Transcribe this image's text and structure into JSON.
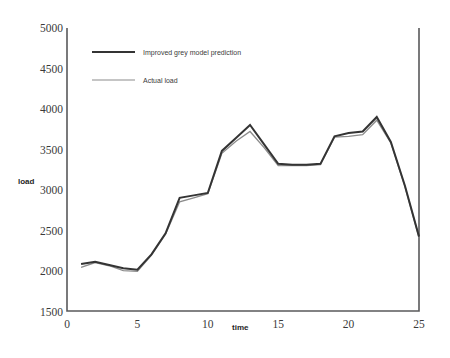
{
  "chart_data": {
    "type": "line",
    "title": "",
    "xlabel": "time",
    "ylabel": "load",
    "xlim": [
      0,
      25
    ],
    "ylim": [
      1500,
      5000
    ],
    "xticks": [
      0,
      5,
      10,
      15,
      20,
      25
    ],
    "yticks": [
      1500,
      2000,
      2500,
      3000,
      3500,
      4000,
      4500,
      5000
    ],
    "grid": false,
    "legend_position": "upper-left-inside",
    "x": [
      1,
      2,
      3,
      4,
      5,
      6,
      7,
      8,
      9,
      10,
      11,
      12,
      13,
      14,
      15,
      16,
      17,
      18,
      19,
      20,
      21,
      22,
      23,
      24,
      25
    ],
    "series": [
      {
        "name": "Improved grey model prediction",
        "color": "#343434",
        "values": [
          2080,
          2110,
          2070,
          2030,
          2010,
          2200,
          2460,
          2900,
          2930,
          2960,
          3480,
          3640,
          3800,
          3560,
          3320,
          3310,
          3310,
          3320,
          3660,
          3700,
          3720,
          3900,
          3590,
          3050,
          2420
        ]
      },
      {
        "name": "Actual load",
        "color": "#8c8c8c",
        "values": [
          2040,
          2100,
          2060,
          2000,
          1990,
          2190,
          2450,
          2850,
          2900,
          2950,
          3450,
          3600,
          3720,
          3520,
          3300,
          3300,
          3300,
          3310,
          3650,
          3660,
          3680,
          3860,
          3580,
          3040,
          2410
        ]
      }
    ]
  },
  "legend": {
    "items": [
      {
        "label": "Improved grey model prediction"
      },
      {
        "label": "Actual load"
      }
    ]
  },
  "axes": {
    "y_label": "load",
    "x_label": "time",
    "y_ticks": [
      "5000",
      "4500",
      "4000",
      "3500",
      "3000",
      "2500",
      "2000",
      "1500"
    ],
    "x_ticks": [
      "0",
      "5",
      "10",
      "15",
      "20",
      "25"
    ]
  },
  "colors": {
    "prediction": "#343434",
    "actual": "#8c8c8c",
    "frame": "#59595b",
    "background": "#ffffff"
  }
}
